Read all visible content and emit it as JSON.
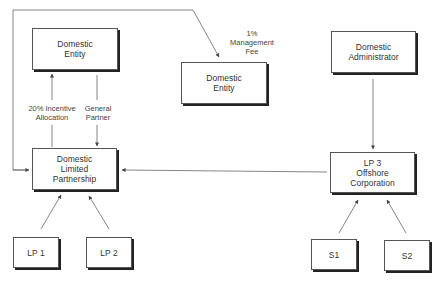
{
  "diagram": {
    "colors": {
      "line": "#666666",
      "box_border": "#555555",
      "shadow": "#222222",
      "text": "#333333"
    },
    "nodes": [
      {
        "id": "domestic-entity-gp",
        "label": "Domestic\nEntity"
      },
      {
        "id": "domestic-entity-mgr",
        "label": "Domestic\nEntity"
      },
      {
        "id": "domestic-administrator",
        "label": "Domestic\nAdministrator"
      },
      {
        "id": "domestic-limited-partnership",
        "label": "Domestic\nLimited\nPartnership"
      },
      {
        "id": "lp3-offshore-corporation",
        "label": "LP 3\nOffshore\nCorporation"
      },
      {
        "id": "lp1",
        "label": "LP 1"
      },
      {
        "id": "lp2",
        "label": "LP 2"
      },
      {
        "id": "s1",
        "label": "S1"
      },
      {
        "id": "s2",
        "label": "S2"
      }
    ],
    "edge_labels": {
      "incentive": "20% Incentive\nAllocation",
      "general_partner": "General\nPartner",
      "management_fee": "1%\nManagement\nFee"
    },
    "edges": [
      {
        "from": "domestic-limited-partnership",
        "to": "domestic-entity-gp",
        "label": "20% Incentive Allocation"
      },
      {
        "from": "domestic-entity-gp",
        "to": "domestic-limited-partnership",
        "label": "General Partner"
      },
      {
        "from": "domestic-limited-partnership",
        "to": "domestic-entity-mgr",
        "label": "1% Management Fee"
      },
      {
        "from": "domestic-administrator",
        "to": "lp3-offshore-corporation",
        "label": ""
      },
      {
        "from": "lp3-offshore-corporation",
        "to": "domestic-limited-partnership",
        "label": ""
      },
      {
        "from": "lp1",
        "to": "domestic-limited-partnership",
        "label": ""
      },
      {
        "from": "lp2",
        "to": "domestic-limited-partnership",
        "label": ""
      },
      {
        "from": "s1",
        "to": "lp3-offshore-corporation",
        "label": ""
      },
      {
        "from": "s2",
        "to": "lp3-offshore-corporation",
        "label": ""
      }
    ]
  }
}
